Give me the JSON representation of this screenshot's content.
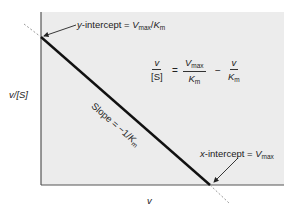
{
  "diagram": {
    "colors": {
      "plot_background": "#ececec",
      "axis": "#555555",
      "line": "#111111",
      "dashed_extension": "#999999",
      "text": "#222222"
    },
    "axes": {
      "x_label": "v",
      "y_label": "v/[S]"
    },
    "line": {
      "slope_label_prefix": "Slope = −1/",
      "slope_label_var": "K",
      "slope_label_sub": "m"
    },
    "annotations": {
      "y_intercept": {
        "prefix": "y",
        "text": "-intercept = ",
        "var1": "V",
        "sub1": "max",
        "sep": "/",
        "var2": "K",
        "sub2": "m"
      },
      "x_intercept": {
        "prefix": "x",
        "text": "-intercept = ",
        "var": "V",
        "sub": "max"
      }
    },
    "equation": {
      "lhs_num": "v",
      "lhs_den": "[S]",
      "equals": "=",
      "term1_num_var": "V",
      "term1_num_sub": "max",
      "term1_den_var": "K",
      "term1_den_sub": "m",
      "minus": "−",
      "term2_num": "v",
      "term2_den_var": "K",
      "term2_den_sub": "m"
    }
  }
}
